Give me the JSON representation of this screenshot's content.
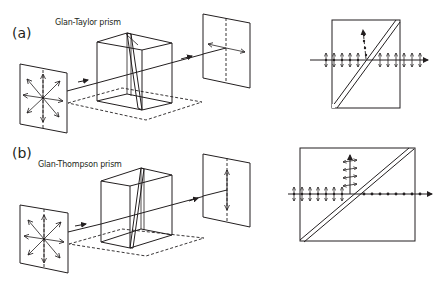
{
  "figure": {
    "panels": [
      {
        "id": "a",
        "label": "(a)",
        "prism_name": "Glan-Taylor prism",
        "input_polarization": "unpolarized",
        "output_polarization": "horizontal",
        "detail_view": {
          "transmitted": "vertical-oscillation arrows (in-plane)",
          "reflected": "dots (out-of-plane), upward"
        }
      },
      {
        "id": "b",
        "label": "(b)",
        "prism_name": "Glan-Thompson prism",
        "input_polarization": "unpolarized",
        "output_polarization": "vertical",
        "detail_view": {
          "transmitted": "dots (out-of-plane)",
          "reflected": "vertical-oscillation arrows, upward"
        }
      }
    ],
    "colors": {
      "line": "#231f20",
      "background": "#ffffff"
    }
  }
}
